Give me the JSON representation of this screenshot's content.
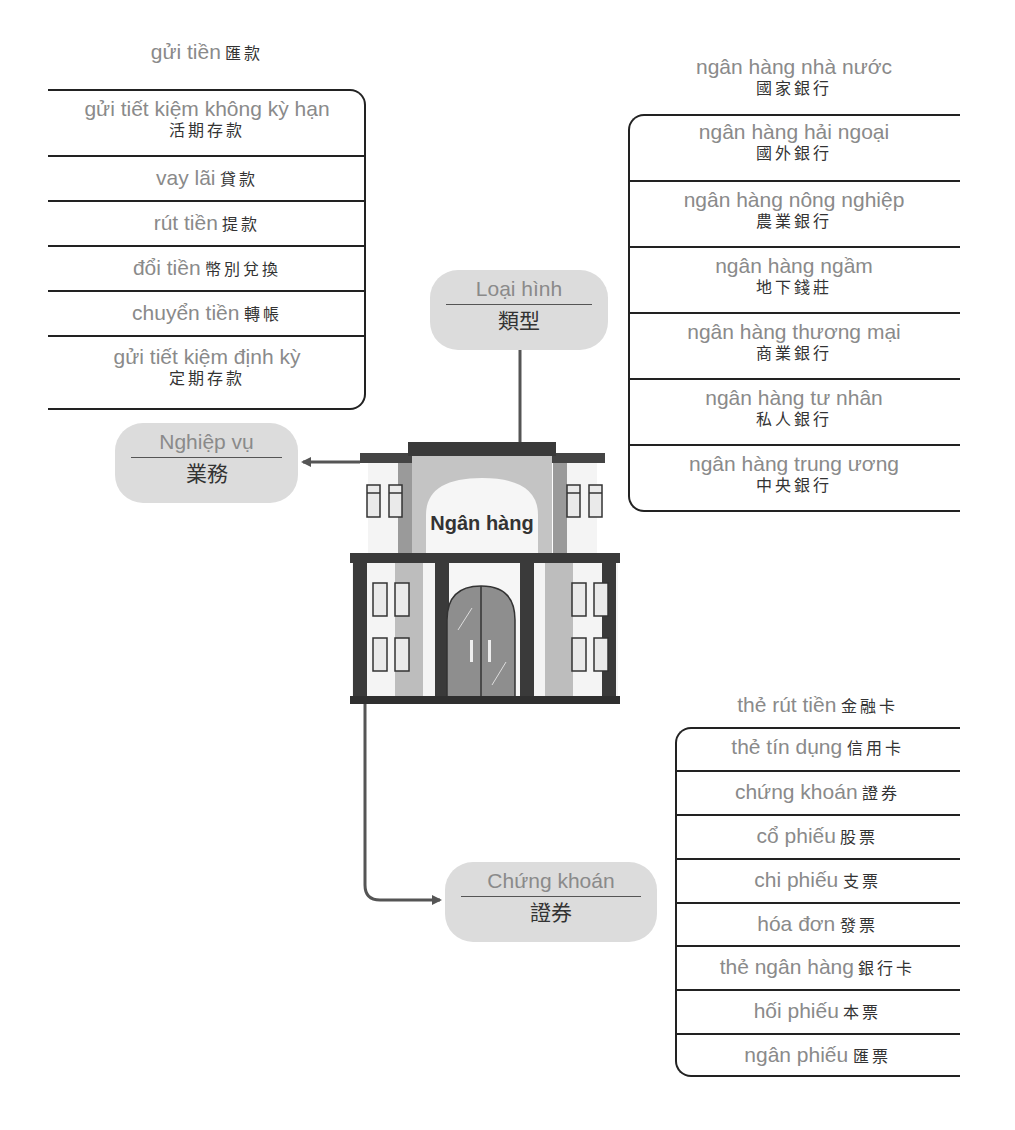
{
  "center": {
    "label": "Ngân hàng"
  },
  "branches": {
    "operations": {
      "vn": "Nghiệp vụ",
      "zh": "業務"
    },
    "types": {
      "vn": "Loại hình",
      "zh": "類型"
    },
    "securities": {
      "vn": "Chứng khoán",
      "zh": "證券"
    }
  },
  "operations_list": {
    "header": {
      "vn": "gửi tiền",
      "zh": "匯款"
    },
    "items": [
      {
        "vn": "gửi tiết kiệm không kỳ hạn",
        "zh": "活期存款"
      },
      {
        "vn": "vay lãi",
        "zh": "貸款"
      },
      {
        "vn": "rút tiền",
        "zh": "提款"
      },
      {
        "vn": "đổi tiền",
        "zh": "幣別兌換"
      },
      {
        "vn": "chuyển tiền",
        "zh": "轉帳"
      },
      {
        "vn": "gửi tiết kiệm định kỳ",
        "zh": "定期存款"
      }
    ]
  },
  "types_list": {
    "header": {
      "vn": "ngân hàng nhà nước",
      "zh": "國家銀行"
    },
    "items": [
      {
        "vn": "ngân hàng hải ngoại",
        "zh": "國外銀行"
      },
      {
        "vn": "ngân hàng nông nghiệp",
        "zh": "農業銀行"
      },
      {
        "vn": "ngân hàng ngầm",
        "zh": "地下錢莊"
      },
      {
        "vn": "ngân hàng thương mại",
        "zh": "商業銀行"
      },
      {
        "vn": "ngân hàng tư nhân",
        "zh": "私人銀行"
      },
      {
        "vn": "ngân hàng trung ương",
        "zh": "中央銀行"
      }
    ]
  },
  "securities_list": {
    "header": {
      "vn": "thẻ rút tiền",
      "zh": "金融卡"
    },
    "items": [
      {
        "vn": "thẻ tín dụng",
        "zh": "信用卡"
      },
      {
        "vn": "chứng khoán",
        "zh": "證券"
      },
      {
        "vn": "cổ phiếu",
        "zh": "股票"
      },
      {
        "vn": "chi phiếu",
        "zh": "支票"
      },
      {
        "vn": "hóa đơn",
        "zh": "發票"
      },
      {
        "vn": "thẻ ngân hàng",
        "zh": "銀行卡"
      },
      {
        "vn": "hối phiếu",
        "zh": "本票"
      },
      {
        "vn": "ngân phiếu",
        "zh": "匯票"
      }
    ]
  }
}
